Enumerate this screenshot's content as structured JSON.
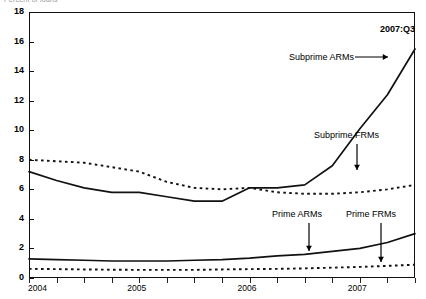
{
  "figure": {
    "clipped_header": "Percent of loans",
    "corner_label": "2007:Q3"
  },
  "annotations": {
    "subprime_arms": "Subprime ARMs",
    "subprime_frms": "Subprime FRMs",
    "prime_arms": "Prime ARMs",
    "prime_frms": "Prime FRMs"
  },
  "axis": {
    "y_ticks": [
      "0",
      "2",
      "4",
      "6",
      "8",
      "10",
      "12",
      "14",
      "16",
      "18"
    ],
    "x_ticks": [
      "2004",
      "2005",
      "2006",
      "2007"
    ]
  },
  "chart_data": {
    "type": "line",
    "title": "Percent of loans",
    "subtitle": "2007:Q3",
    "xlabel": "",
    "ylabel": "Percent",
    "ylim": [
      0,
      18
    ],
    "xlim": [
      "2004:Q1",
      "2007:Q3"
    ],
    "y_ticks": [
      0,
      2,
      4,
      6,
      8,
      10,
      12,
      14,
      16,
      18
    ],
    "x_tick_labels": [
      "2004",
      "2005",
      "2006",
      "2007"
    ],
    "grid": false,
    "legend": "inline-annotations",
    "x": [
      "2004:Q1",
      "2004:Q2",
      "2004:Q3",
      "2004:Q4",
      "2005:Q1",
      "2005:Q2",
      "2005:Q3",
      "2005:Q4",
      "2006:Q1",
      "2006:Q2",
      "2006:Q3",
      "2006:Q4",
      "2007:Q1",
      "2007:Q2",
      "2007:Q3"
    ],
    "series": [
      {
        "name": "Subprime ARMs",
        "style": "solid",
        "color": "#111111",
        "values": [
          7.2,
          6.6,
          6.1,
          5.8,
          5.8,
          5.5,
          5.2,
          5.2,
          6.1,
          6.1,
          6.3,
          7.6,
          10.1,
          12.4,
          15.5
        ]
      },
      {
        "name": "Subprime FRMs",
        "style": "dotted",
        "color": "#111111",
        "values": [
          8.0,
          7.9,
          7.8,
          7.5,
          7.2,
          6.5,
          6.1,
          6.0,
          6.1,
          5.8,
          5.7,
          5.7,
          5.8,
          6.0,
          6.3
        ]
      },
      {
        "name": "Prime ARMs",
        "style": "solid",
        "color": "#111111",
        "values": [
          1.3,
          1.25,
          1.2,
          1.15,
          1.15,
          1.15,
          1.2,
          1.25,
          1.35,
          1.5,
          1.6,
          1.8,
          2.0,
          2.4,
          3.0
        ]
      },
      {
        "name": "Prime FRMs",
        "style": "dotted",
        "color": "#111111",
        "values": [
          0.62,
          0.6,
          0.58,
          0.56,
          0.55,
          0.55,
          0.55,
          0.58,
          0.6,
          0.62,
          0.65,
          0.7,
          0.75,
          0.82,
          0.9
        ]
      }
    ]
  }
}
